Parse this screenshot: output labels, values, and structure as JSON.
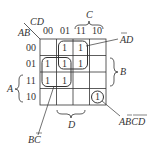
{
  "kmap": {
    "row_var": "AB",
    "col_var": "CD",
    "col_labels": [
      "00",
      "01",
      "11",
      "10"
    ],
    "row_labels": [
      "00",
      "01",
      "11",
      "10"
    ],
    "cells": [
      [
        "",
        "1",
        "1",
        ""
      ],
      [
        "1",
        "1",
        "1",
        ""
      ],
      [
        "1",
        "1",
        "",
        ""
      ],
      [
        "",
        "",
        "",
        "1"
      ]
    ],
    "brace_labels": {
      "C": "C",
      "B": "B",
      "A": "A",
      "D": "D"
    },
    "groups": [
      {
        "name": "A̅D",
        "label": "AD",
        "overline": "A"
      },
      {
        "name": "BC̅",
        "label": "BC",
        "overline": "C"
      },
      {
        "name": "AB̅C̅D̅",
        "label": "ABCD",
        "overline": "BCD"
      }
    ]
  }
}
